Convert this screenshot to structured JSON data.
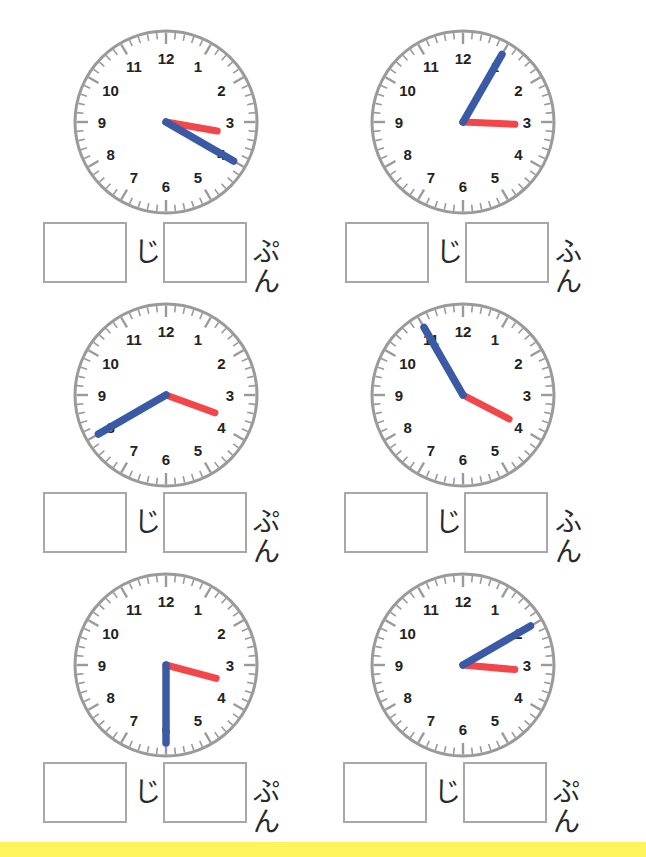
{
  "worksheet": {
    "hour_unit_label": "じ",
    "colors": {
      "hour_hand": "#f2464a",
      "minute_hand": "#3b5aa5",
      "dial": "#9a9a9a",
      "numbers": "#222222",
      "box_border": "#a8a8a8",
      "bottom_band": "#fff55a"
    },
    "numbers": [
      "12",
      "1",
      "2",
      "3",
      "4",
      "5",
      "6",
      "7",
      "8",
      "9",
      "10",
      "11"
    ],
    "clocks": [
      {
        "id": "clock-1",
        "hour": 3,
        "minute": 20,
        "minute_unit_label": "ぷん"
      },
      {
        "id": "clock-2",
        "hour": 3,
        "minute": 5,
        "minute_unit_label": "ふん"
      },
      {
        "id": "clock-3",
        "hour": 3,
        "minute": 40,
        "minute_unit_label": "ぷん"
      },
      {
        "id": "clock-4",
        "hour": 3,
        "minute": 55,
        "minute_unit_label": "ふん"
      },
      {
        "id": "clock-5",
        "hour": 3,
        "minute": 30,
        "minute_unit_label": "ぷん"
      },
      {
        "id": "clock-6",
        "hour": 3,
        "minute": 10,
        "minute_unit_label": "ぷん"
      }
    ],
    "answers": [
      {
        "hour_value": "",
        "minute_value": ""
      },
      {
        "hour_value": "",
        "minute_value": ""
      },
      {
        "hour_value": "",
        "minute_value": ""
      },
      {
        "hour_value": "",
        "minute_value": ""
      },
      {
        "hour_value": "",
        "minute_value": ""
      },
      {
        "hour_value": "",
        "minute_value": ""
      }
    ]
  }
}
